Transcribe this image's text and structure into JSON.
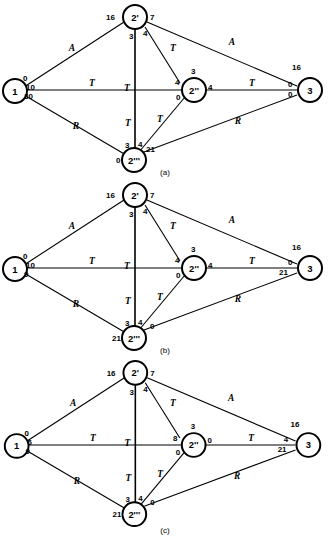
{
  "figure": {
    "node_names": {
      "n1": "1",
      "n2p": "2'",
      "n2pp": "2''",
      "n2ppp": "2'''",
      "n3": "3"
    },
    "edge_types": {
      "A": "A",
      "T": "T",
      "R": "R"
    }
  },
  "panels": [
    {
      "id": "a",
      "caption": "(a)",
      "nodes": {
        "n1": {
          "label": "1",
          "annotations": {
            "top": "0",
            "mid": "10",
            "bottom": "30"
          }
        },
        "n2p": {
          "label": "2'",
          "annotations": {
            "left": "16",
            "right": "7",
            "below_left": "3",
            "below_right": "4"
          }
        },
        "n2pp": {
          "label": "2''",
          "annotations": {
            "top": "3",
            "left": "4",
            "right": "4",
            "bottom_left": "0"
          }
        },
        "n2ppp": {
          "label": "2'''",
          "annotations": {
            "left": "0",
            "above_left": "3",
            "above_mid": "4",
            "above_right": "21"
          }
        },
        "n3": {
          "label": "3",
          "annotations": {
            "top": "16",
            "left_upper": "0",
            "left_lower": "0"
          }
        }
      },
      "edges": [
        {
          "from": "n1",
          "to": "n2p",
          "label": "A"
        },
        {
          "from": "n1",
          "to": "n2pp",
          "label": "T"
        },
        {
          "from": "n1",
          "to": "n2ppp",
          "label": "R"
        },
        {
          "from": "n2p",
          "to": "n3",
          "label": "A"
        },
        {
          "from": "n2p",
          "to": "n2pp",
          "label": "T"
        },
        {
          "from": "n2p",
          "to": "n2ppp",
          "label": "T"
        },
        {
          "from": "n2pp",
          "to": "n3",
          "label": "T"
        },
        {
          "from": "n2ppp",
          "to": "n2pp",
          "label": "T"
        },
        {
          "from": "n2ppp",
          "to": "n3",
          "label": "R"
        }
      ]
    },
    {
      "id": "b",
      "caption": "(b)",
      "nodes": {
        "n1": {
          "label": "1",
          "annotations": {
            "top": "0",
            "mid": "10",
            "bottom": "9"
          }
        },
        "n2p": {
          "label": "2'",
          "annotations": {
            "left": "16",
            "right": "7",
            "below_left": "3",
            "below_right": "4"
          }
        },
        "n2pp": {
          "label": "2''",
          "annotations": {
            "top": "3",
            "left": "4",
            "right": "4",
            "bottom_left": "0"
          }
        },
        "n2ppp": {
          "label": "2'''",
          "annotations": {
            "left": "21",
            "above_left": "3",
            "above_mid": "4",
            "above_right": "0"
          }
        },
        "n3": {
          "label": "3",
          "annotations": {
            "top": "16",
            "left_upper": "0",
            "left_lower": "21"
          }
        }
      },
      "edges": [
        {
          "from": "n1",
          "to": "n2p",
          "label": "A"
        },
        {
          "from": "n1",
          "to": "n2pp",
          "label": "T"
        },
        {
          "from": "n1",
          "to": "n2ppp",
          "label": "R"
        },
        {
          "from": "n2p",
          "to": "n3",
          "label": "A"
        },
        {
          "from": "n2p",
          "to": "n2pp",
          "label": "T"
        },
        {
          "from": "n2p",
          "to": "n2ppp",
          "label": "T"
        },
        {
          "from": "n2pp",
          "to": "n3",
          "label": "T"
        },
        {
          "from": "n2ppp",
          "to": "n2pp",
          "label": "T"
        },
        {
          "from": "n2ppp",
          "to": "n3",
          "label": "R"
        }
      ]
    },
    {
      "id": "c",
      "caption": "(c)",
      "nodes": {
        "n1": {
          "label": "1",
          "annotations": {
            "top": "0",
            "mid": "6",
            "bottom": "9"
          }
        },
        "n2p": {
          "label": "2'",
          "annotations": {
            "left": "16",
            "right": "7",
            "below_left": "3",
            "below_right": "4"
          }
        },
        "n2pp": {
          "label": "2''",
          "annotations": {
            "top": "3",
            "left": "8",
            "right": "0",
            "bottom_left": "0"
          }
        },
        "n2ppp": {
          "label": "2'''",
          "annotations": {
            "left": "21",
            "above_left": "3",
            "above_mid": "4",
            "above_right": "0"
          }
        },
        "n3": {
          "label": "3",
          "annotations": {
            "top": "16",
            "left_upper": "4",
            "left_lower": "21"
          }
        }
      },
      "edges": [
        {
          "from": "n1",
          "to": "n2p",
          "label": "A"
        },
        {
          "from": "n1",
          "to": "n2pp",
          "label": "T"
        },
        {
          "from": "n1",
          "to": "n2ppp",
          "label": "R"
        },
        {
          "from": "n2p",
          "to": "n3",
          "label": "A"
        },
        {
          "from": "n2p",
          "to": "n2pp",
          "label": "T"
        },
        {
          "from": "n2p",
          "to": "n2ppp",
          "label": "T"
        },
        {
          "from": "n2pp",
          "to": "n3",
          "label": "T"
        },
        {
          "from": "n2ppp",
          "to": "n2pp",
          "label": "T"
        },
        {
          "from": "n2ppp",
          "to": "n3",
          "label": "R"
        }
      ]
    }
  ]
}
